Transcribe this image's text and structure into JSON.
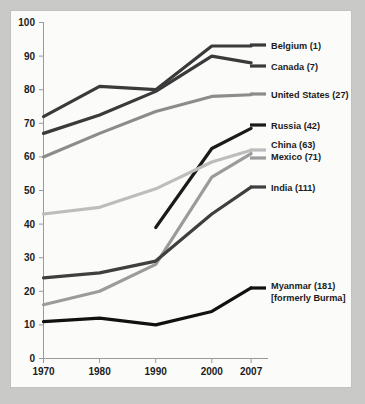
{
  "page": {
    "background_color": "#c9c9c7",
    "card_color": "#fbfbfa"
  },
  "chart_data": {
    "type": "line",
    "title": "",
    "subtitle": "",
    "xlabel": "",
    "ylabel": "",
    "x": [
      1970,
      1980,
      1990,
      2000,
      2007
    ],
    "xtick_labels": [
      "1970",
      "1980",
      "1990",
      "2000",
      "2007"
    ],
    "ytick_labels": [
      "0",
      "10",
      "20",
      "30",
      "40",
      "50",
      "60",
      "70",
      "80",
      "90",
      "100"
    ],
    "yticks": [
      0,
      10,
      20,
      30,
      40,
      50,
      60,
      70,
      80,
      90,
      100
    ],
    "ylim": [
      0,
      100
    ],
    "grid": false,
    "legend_position": "right-inline",
    "series": [
      {
        "name": "Belgium (1)",
        "label": "Belgium (1)",
        "color": "#3a3a3a",
        "x": [
          1970,
          1980,
          1990,
          2000,
          2007
        ],
        "values": [
          72,
          81,
          80,
          93,
          93
        ]
      },
      {
        "name": "Canada (7)",
        "label": "Canada (7)",
        "color": "#3a3a3a",
        "x": [
          1970,
          1980,
          1990,
          2000,
          2007
        ],
        "values": [
          67,
          72.5,
          79.5,
          90,
          88
        ]
      },
      {
        "name": "United States (27)",
        "label": "United States (27)",
        "color": "#8c8c8c",
        "x": [
          1970,
          1980,
          1990,
          2000,
          2007
        ],
        "values": [
          60,
          67,
          73.5,
          78,
          78.5
        ]
      },
      {
        "name": "Russia (42)",
        "label": "Russia (42)",
        "color": "#1a1a1a",
        "x": [
          1990,
          2000,
          2007
        ],
        "values": [
          39,
          62.5,
          68.5
        ]
      },
      {
        "name": "China (63)",
        "label": "China (63)",
        "color": "#bdbdbd",
        "x": [
          1970,
          1980,
          1990,
          2000,
          2007
        ],
        "values": [
          43,
          45,
          50.5,
          58.5,
          62
        ]
      },
      {
        "name": "Mexico (71)",
        "label": "Mexico (71)",
        "color": "#9b9b9b",
        "x": [
          1970,
          1980,
          1990,
          2000,
          2007
        ],
        "values": [
          16,
          20,
          28,
          54,
          61
        ]
      },
      {
        "name": "India (111)",
        "label": "India (111)",
        "color": "#3f3f3f",
        "x": [
          1970,
          1980,
          1990,
          2000,
          2007
        ],
        "values": [
          24,
          25.5,
          29,
          43,
          51
        ]
      },
      {
        "name": "Myanmar (181) [formerly Burma]",
        "label": "Myanmar (181)",
        "label_line2": "[formerly Burma]",
        "color": "#111111",
        "x": [
          1970,
          1980,
          1990,
          2000,
          2007
        ],
        "values": [
          11,
          12,
          10,
          14,
          21
        ]
      }
    ],
    "legend_entries": [
      {
        "label": "Belgium (1)",
        "color": "#3a3a3a"
      },
      {
        "label": "Canada (7)",
        "color": "#3a3a3a"
      },
      {
        "label": "United States (27)",
        "color": "#8c8c8c"
      },
      {
        "label": "Russia (42)",
        "color": "#1a1a1a"
      },
      {
        "label": "China (63)",
        "color": "#bdbdbd"
      },
      {
        "label": "Mexico (71)",
        "color": "#9b9b9b"
      },
      {
        "label": "India (111)",
        "color": "#3f3f3f"
      },
      {
        "label": "Myanmar (181)",
        "label_line2": "[formerly Burma]",
        "color": "#111111"
      }
    ]
  }
}
